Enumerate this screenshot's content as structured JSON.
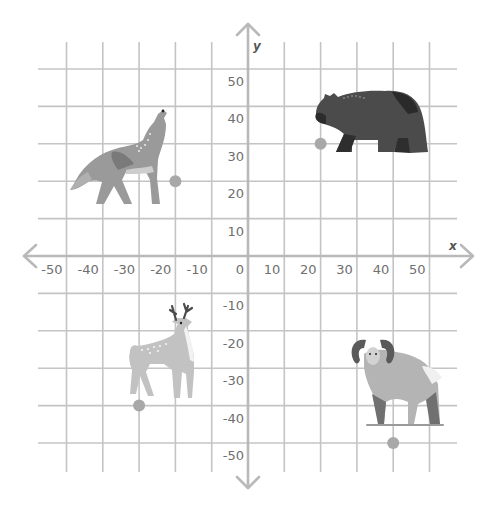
{
  "chart_data": {
    "type": "scatter",
    "title": "",
    "xlabel": "x",
    "ylabel": "y",
    "xlim": [
      -55,
      55
    ],
    "ylim": [
      -55,
      55
    ],
    "grid": true,
    "x_ticks": [
      -50,
      -40,
      -30,
      -20,
      -10,
      0,
      10,
      20,
      30,
      40,
      50
    ],
    "y_ticks": [
      50,
      40,
      30,
      20,
      10,
      -10,
      -20,
      -30,
      -40,
      -50
    ],
    "x_tick_labels": [
      "-50",
      "-40",
      "-30",
      "-20",
      "-10",
      "0",
      "10",
      "20",
      "30",
      "40",
      "50"
    ],
    "y_tick_labels": [
      "50",
      "40",
      "30",
      "20",
      "10",
      "-10",
      "-20",
      "-30",
      "-40",
      "-50"
    ],
    "points": [
      {
        "name": "wolf",
        "icon": "wolf-icon",
        "x": -20,
        "y": 20
      },
      {
        "name": "bear",
        "icon": "bear-icon",
        "x": 20,
        "y": 30
      },
      {
        "name": "deer",
        "icon": "deer-icon",
        "x": -30,
        "y": -40
      },
      {
        "name": "ram",
        "icon": "ram-icon",
        "x": 40,
        "y": -50
      }
    ]
  },
  "colors": {
    "grid": "#c4c4c4",
    "axis": "#b9b9b9",
    "point": "#a8a8a8",
    "label": "#6f6f6f"
  }
}
